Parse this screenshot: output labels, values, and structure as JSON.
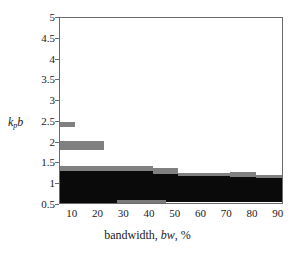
{
  "chart_data": {
    "type": "area",
    "title": "",
    "xlabel": "bandwidth, bw, %",
    "xlabel_parts": {
      "prefix": "bandwidth, ",
      "italic": "bw",
      "suffix": ", %"
    },
    "ylabel": "kpb",
    "ylabel_parts": {
      "main": "k",
      "sub": "p",
      "tail": "b"
    },
    "xlim": [
      5,
      92
    ],
    "ylim": [
      0.5,
      5
    ],
    "xticks": [
      10,
      20,
      30,
      40,
      50,
      60,
      70,
      80,
      90
    ],
    "yticks": [
      0.5,
      1,
      1.5,
      2,
      2.5,
      3,
      3.5,
      4,
      4.5,
      5
    ],
    "grid": false,
    "legend": "none",
    "colors": {
      "upper_band": "#808080",
      "fill": "#0a0a0a",
      "lower_band": "#7a7a7a",
      "frame": "#6b6b6b",
      "background": "#ffffff"
    },
    "series": [
      {
        "name": "upper boundary (gray band)",
        "color": "#808080",
        "steps": [
          {
            "x_start": 5,
            "x_end": 11,
            "y_top": 2.5,
            "y_bottom": 2.38
          },
          {
            "x_start": 5,
            "x_end": 22,
            "y_top": 2.05,
            "y_bottom": 1.82
          },
          {
            "x_start": 5,
            "x_end": 41,
            "y_top": 1.45,
            "y_bottom": 1.33
          },
          {
            "x_start": 41,
            "x_end": 51,
            "y_top": 1.38,
            "y_bottom": 1.25
          },
          {
            "x_start": 51,
            "x_end": 71,
            "y_top": 1.28,
            "y_bottom": 1.2
          },
          {
            "x_start": 71,
            "x_end": 81,
            "y_top": 1.3,
            "y_bottom": 1.18
          },
          {
            "x_start": 81,
            "x_end": 92,
            "y_top": 1.22,
            "y_bottom": 1.14
          }
        ]
      },
      {
        "name": "filled region (black)",
        "color": "#0a0a0a",
        "steps": [
          {
            "x_start": 5,
            "x_end": 41,
            "y_top": 1.33,
            "y_bottom": 0.62
          },
          {
            "x_start": 41,
            "x_end": 51,
            "y_top": 1.25,
            "y_bottom": 0.62
          },
          {
            "x_start": 51,
            "x_end": 71,
            "y_top": 1.2,
            "y_bottom": 0.62
          },
          {
            "x_start": 71,
            "x_end": 81,
            "y_top": 1.18,
            "y_bottom": 0.62
          },
          {
            "x_start": 81,
            "x_end": 92,
            "y_top": 1.14,
            "y_bottom": 0.62
          }
        ]
      },
      {
        "name": "lower boundary band",
        "color": "#7a7a7a",
        "steps": [
          {
            "x_start": 5,
            "x_end": 27,
            "y_top": 0.62,
            "y_bottom": 0.5,
            "color": "#0a0a0a"
          },
          {
            "x_start": 27,
            "x_end": 46,
            "y_top": 0.62,
            "y_bottom": 0.5,
            "color": "#7a7a7a"
          },
          {
            "x_start": 46,
            "x_end": 92,
            "y_top": 0.62,
            "y_bottom": 0.57,
            "color": "#0a0a0a"
          }
        ]
      }
    ]
  }
}
